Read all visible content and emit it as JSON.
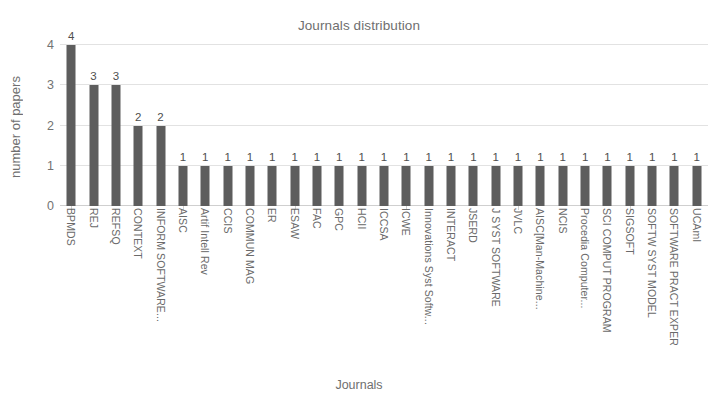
{
  "chart_data": {
    "type": "bar",
    "title": "Journals distribution",
    "xlabel": "Journals",
    "ylabel": "number of papers",
    "ylim": [
      0,
      4
    ],
    "yticks": [
      0,
      1,
      2,
      3,
      4
    ],
    "grid": true,
    "legend": false,
    "orientation": "vertical",
    "bar_color": "#5d5d5d",
    "gridline_color": "#e2e2e2",
    "show_data_labels": true,
    "categories": [
      "BPMDS",
      "REJ",
      "REFSQ",
      "CONTEXT",
      "INFORM SOFTWARE...",
      "AISC",
      "Artif Intell Rev",
      "CCIS",
      "COMMUN MAG",
      "ER",
      "ESAW",
      "FAC",
      "GPC",
      "HCII",
      "ICCSA",
      "ICWE",
      "Innovations Syst Softw...",
      "INTERACT",
      "JSERD",
      "J SYST SOFTWARE",
      "JVLC",
      "AISC[Man-Machine...",
      "NCIS",
      "Procedia Computer...",
      "SCI COMPUT PROGRAM",
      "SIGSOFT",
      "SOFTW SYST MODEL",
      "SOFTWARE PRACT EXPER",
      "UCAmI"
    ],
    "values": [
      4,
      3,
      3,
      2,
      2,
      1,
      1,
      1,
      1,
      1,
      1,
      1,
      1,
      1,
      1,
      1,
      1,
      1,
      1,
      1,
      1,
      1,
      1,
      1,
      1,
      1,
      1,
      1,
      1
    ]
  }
}
